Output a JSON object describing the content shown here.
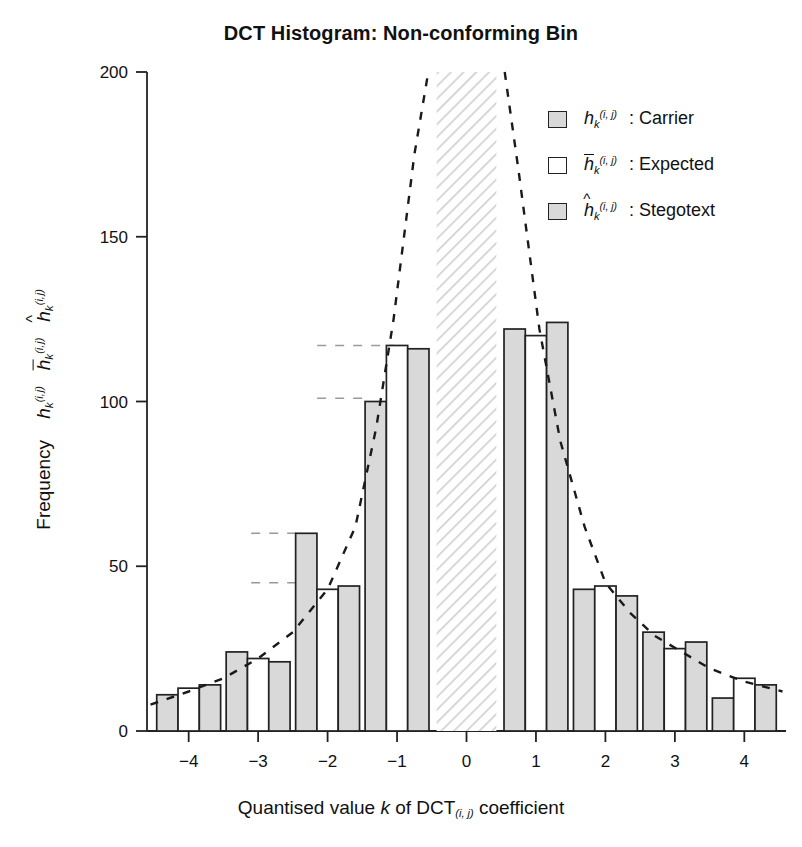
{
  "chart_data": {
    "type": "bar",
    "title": "DCT Histogram: Non-conforming Bin",
    "xlabel": "Quantised value k of DCT(i,j) coefficient",
    "ylabel": "Frequency h_k^(i,j)  h̄_k^(i,j)  ĥ_k^(i,j)",
    "categories": [
      "-4",
      "-3",
      "-2",
      "-1",
      "0",
      "1",
      "2",
      "3",
      "4"
    ],
    "xlim": [
      -4.6,
      4.6
    ],
    "ylim": [
      0,
      200
    ],
    "yticks": [
      0,
      50,
      100,
      150,
      200
    ],
    "xticks": [
      -4,
      -3,
      -2,
      -1,
      0,
      1,
      2,
      3,
      4
    ],
    "grid": false,
    "legend_position": "top-right",
    "series": [
      {
        "name": "Carrier",
        "symbol": "h_k^(i,j)",
        "fill": "#d9d9d9",
        "values": [
          11,
          24,
          60,
          100,
          null,
          122,
          43,
          30,
          10
        ]
      },
      {
        "name": "Expected",
        "symbol": "h̄_k^(i,j)",
        "fill": "#ffffff",
        "values": [
          13,
          22,
          43,
          117,
          null,
          120,
          44,
          25,
          16
        ]
      },
      {
        "name": "Stegotext",
        "symbol": "ĥ_k^(i,j)",
        "fill": "#d9d9d9",
        "values": [
          14,
          21,
          44,
          116,
          null,
          124,
          41,
          27,
          14
        ]
      }
    ],
    "truncated_bin": {
      "category": "0",
      "note": "non-conforming bin, hatched, exceeds axis maximum",
      "fill": "hatched"
    },
    "reference_lines": [
      {
        "value": 117,
        "from_x": -2.15,
        "to_x": -1.05
      },
      {
        "value": 101,
        "from_x": -2.15,
        "to_x": -1.4
      },
      {
        "value": 60,
        "from_x": -3.1,
        "to_x": -2.38
      },
      {
        "value": 45,
        "from_x": -3.1,
        "to_x": -2.38
      }
    ],
    "fit_curve": {
      "style": "dashed",
      "description": "Laplacian/exponential fit through expected frequencies",
      "points_x": [
        -4.55,
        -4.0,
        -3.5,
        -3.0,
        -2.5,
        -2.0,
        -1.6,
        -1.3,
        -1.05,
        -0.75,
        -0.55,
        0.55,
        0.75,
        1.05,
        1.35,
        1.7,
        2.0,
        2.35,
        2.7,
        3.1,
        3.5,
        4.0,
        4.55
      ],
      "points_y": [
        8,
        12,
        16,
        22,
        30,
        43,
        62,
        92,
        125,
        175,
        200,
        200,
        170,
        122,
        88,
        62,
        45,
        36,
        29,
        24,
        19,
        15,
        12
      ]
    }
  },
  "header": {
    "title": "DCT Histogram: Non-conforming Bin"
  },
  "axes": {
    "y_ticks": [
      "200",
      "150",
      "100",
      "50",
      "0"
    ],
    "x_ticks": [
      "-4",
      "-3",
      "-2",
      "-1",
      "0",
      "1",
      "2",
      "3",
      "4"
    ],
    "x_label_parts": {
      "pre": "Quantised value ",
      "k": "k",
      "mid": " of DCT",
      "sub": "(i, j)",
      "post": " coefficient"
    },
    "y_label_parts": {
      "word": "Frequency"
    }
  },
  "legend": {
    "items": [
      {
        "swatch": "grey",
        "base": "h",
        "sub": "k",
        "sup": "(i, j)",
        "accent": "none",
        "label": ": Carrier"
      },
      {
        "swatch": "white",
        "base": "h",
        "sub": "k",
        "sup": "(i, j)",
        "accent": "bar",
        "label": ": Expected"
      },
      {
        "swatch": "grey",
        "base": "h",
        "sub": "k",
        "sup": "(i, j)",
        "accent": "hat",
        "label": ": Stegotext"
      }
    ]
  }
}
